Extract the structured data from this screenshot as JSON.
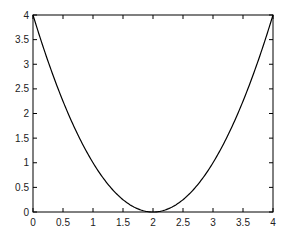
{
  "chart_data": {
    "type": "line",
    "title": "",
    "xlabel": "",
    "ylabel": "",
    "xlim": [
      0,
      4
    ],
    "ylim": [
      0,
      4
    ],
    "grid": false,
    "legend": null,
    "xticks": [
      "0",
      "0.5",
      "1",
      "1.5",
      "2",
      "2.5",
      "3",
      "3.5",
      "4"
    ],
    "yticks": [
      "0",
      "0.5",
      "1",
      "1.5",
      "2",
      "2.5",
      "3",
      "3.5",
      "4"
    ],
    "series": [
      {
        "name": "y = (x-2)^2",
        "color": "#000000",
        "x": [
          0,
          0.25,
          0.5,
          0.75,
          1,
          1.25,
          1.5,
          1.75,
          2,
          2.25,
          2.5,
          2.75,
          3,
          3.25,
          3.5,
          3.75,
          4
        ],
        "y": [
          4,
          3.0625,
          2.25,
          1.5625,
          1,
          0.5625,
          0.25,
          0.0625,
          0,
          0.0625,
          0.25,
          0.5625,
          1,
          1.5625,
          2.25,
          3.0625,
          4
        ]
      }
    ]
  }
}
